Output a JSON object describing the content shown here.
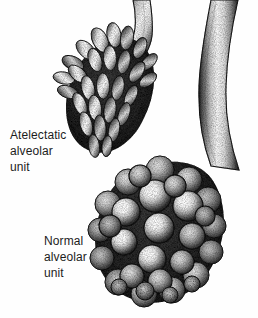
{
  "figure": {
    "background_color": "#fefefe",
    "ink_color": "#1c1c1c",
    "style": "stipple engraving medical illustration",
    "width": 258,
    "height": 318,
    "top_cropped_text": ""
  },
  "labels": {
    "atelectatic": {
      "line1": "Atelectatic",
      "line2": "alveolar",
      "line3": "unit"
    },
    "normal": {
      "line1": "Normal",
      "line2": "alveolar",
      "line3": "unit"
    }
  },
  "structures": {
    "bronchiole_left": "bronchiole-left",
    "bronchiole_right": "bronchiole-right",
    "atelectatic_unit": "atelectatic-alveolar-cluster",
    "normal_unit": "normal-alveolar-cluster"
  },
  "colors": {
    "ink": "#1c1c1c",
    "shadow": "#262626",
    "midtone": "#6f6f6f",
    "highlight": "#fdfdfd",
    "paper": "#fefefe"
  }
}
